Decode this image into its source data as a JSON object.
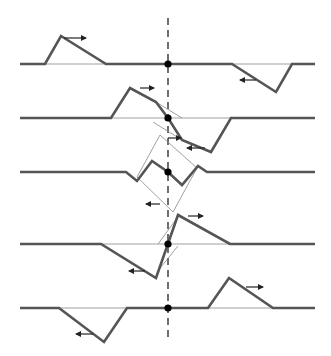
{
  "colors": {
    "background": "#ffffff",
    "wave": "#555555",
    "thin": "#888888",
    "axis": "#222222",
    "dot": "#000000"
  },
  "center_line": {
    "x": 168,
    "y_top": 18,
    "y_bottom": 340,
    "style": "dashed"
  },
  "rows": [
    {
      "label": "frame-1",
      "baseline_y": 64,
      "wave": "20,64 45,64 61,36 106,64 232,64 276,92 292,64 315,64",
      "components": [
        "45,64 106,64",
        "232,64 292,64"
      ],
      "arrows": [
        {
          "x1": 64,
          "y1": 38,
          "x2": 86,
          "y2": 38
        },
        {
          "x1": 256,
          "y1": 80,
          "x2": 240,
          "y2": 80
        }
      ]
    },
    {
      "label": "frame-2",
      "baseline_y": 118,
      "wave": "20,118 111,118 130,88 156,102 168,118 182,140 211,152 231,118 315,118",
      "components": [
        "111,118 231,118",
        "156,102 182,118",
        "153,122 182,140"
      ],
      "arrows": [
        {
          "x1": 140,
          "y1": 88,
          "x2": 154,
          "y2": 88
        },
        {
          "x1": 168,
          "y1": 138,
          "x2": 181,
          "y2": 138
        },
        {
          "x1": 205,
          "y1": 148,
          "x2": 187,
          "y2": 148
        }
      ]
    },
    {
      "label": "frame-3",
      "baseline_y": 172,
      "wave": "20,172 126,172 137,181 152,161 168,172 182,185 198,166 207,172 315,172",
      "components": [
        "137,177 160,135 197,168 173,212 137,177"
      ],
      "arrows": [
        {
          "x1": 160,
          "y1": 204,
          "x2": 146,
          "y2": 204
        }
      ]
    },
    {
      "label": "frame-4",
      "baseline_y": 244,
      "wave": "20,244 101,244 156,278 178,215 230,244 315,244",
      "components": [
        "101,244 230,244",
        "158,244 180,214",
        "157,272 178,246"
      ],
      "arrows": [
        {
          "x1": 188,
          "y1": 216,
          "x2": 203,
          "y2": 216
        },
        {
          "x1": 145,
          "y1": 271,
          "x2": 129,
          "y2": 271
        }
      ]
    },
    {
      "label": "frame-5",
      "baseline_y": 308,
      "wave": "20,308 59,308 104,342 127,308 208,308 229,278 273,308 315,308",
      "components": [
        "59,308 127,308",
        "208,308 273,308"
      ],
      "arrows": [
        {
          "x1": 246,
          "y1": 287,
          "x2": 263,
          "y2": 287
        },
        {
          "x1": 93,
          "y1": 334,
          "x2": 76,
          "y2": 334
        }
      ]
    }
  ]
}
